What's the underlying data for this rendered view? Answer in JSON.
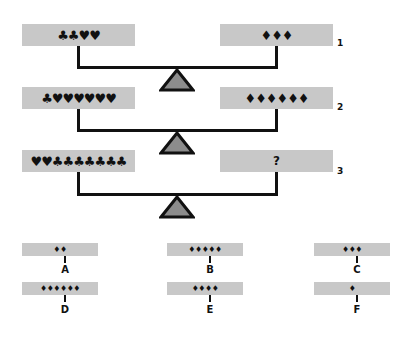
{
  "puzzle": {
    "rows": [
      {
        "number": "1",
        "left": "♣♣♥♥",
        "right": "♦♦♦"
      },
      {
        "number": "2",
        "left": "♣♥♥♥♥♥♥",
        "right": "♦♦♦♦♦♦"
      },
      {
        "number": "3",
        "left": "♥♥♣♣♣♣♣♣♣",
        "right": "?"
      }
    ],
    "options": [
      {
        "label": "A",
        "value": "♦♦"
      },
      {
        "label": "B",
        "value": "♦♦♦♦♦"
      },
      {
        "label": "C",
        "value": "♦♦♦"
      },
      {
        "label": "D",
        "value": "♦♦♦♦♦♦"
      },
      {
        "label": "E",
        "value": "♦♦♦♦"
      },
      {
        "label": "F",
        "value": "♦"
      }
    ]
  },
  "colors": {
    "pan": "#c8c8c8",
    "fulcrum_fill": "#8c8c8c",
    "ink": "#111111"
  }
}
